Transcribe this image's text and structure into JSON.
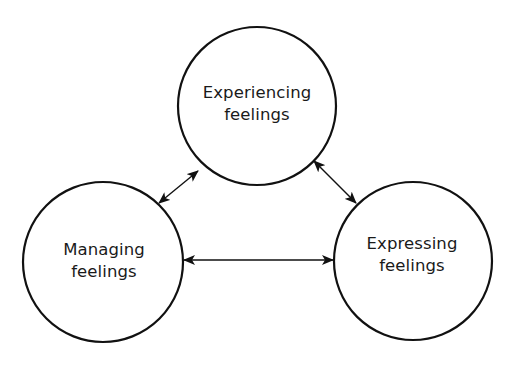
{
  "diagram": {
    "type": "cycle",
    "stroke_color": "#111111",
    "background": "#ffffff",
    "nodes": [
      {
        "id": "experiencing",
        "line1": "Experiencing",
        "line2": "feelings",
        "cx": 257,
        "cy": 106,
        "r": 79
      },
      {
        "id": "managing",
        "line1": "Managing",
        "line2": "feelings",
        "cx": 103,
        "cy": 262,
        "r": 80
      },
      {
        "id": "expressing",
        "line1": "Expressing",
        "line2": "feelings",
        "cx": 413,
        "cy": 261,
        "r": 79
      }
    ],
    "edges": [
      {
        "from": "managing",
        "to": "experiencing",
        "bidirectional": true
      },
      {
        "from": "experiencing",
        "to": "expressing",
        "bidirectional": true
      },
      {
        "from": "managing",
        "to": "expressing",
        "bidirectional": true
      }
    ]
  }
}
